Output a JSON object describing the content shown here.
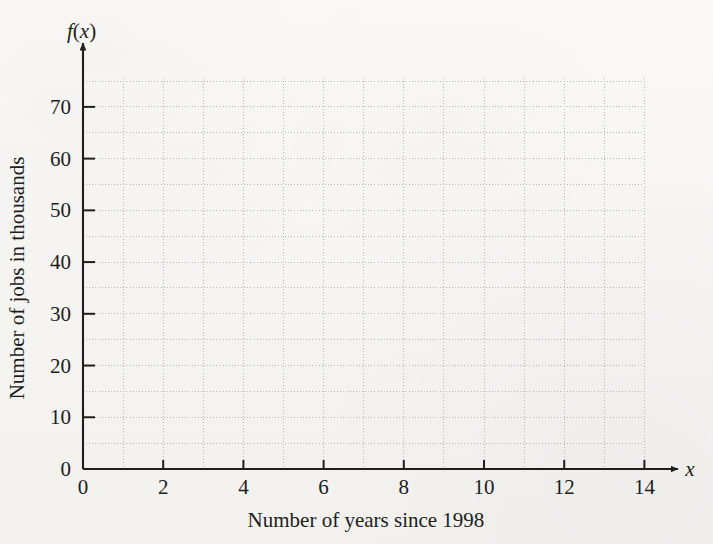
{
  "chart_data": {
    "type": "line",
    "title": "",
    "subtitle": "",
    "xlabel": "Number of years since 1998",
    "ylabel": "Number of jobs in thousands",
    "x_axis_name": "x",
    "y_axis_name": "f(x)",
    "xlim": [
      0,
      14
    ],
    "ylim": [
      0,
      75
    ],
    "x_tick_labels": [
      "0",
      "2",
      "4",
      "6",
      "8",
      "10",
      "12",
      "14"
    ],
    "x_tick_values": [
      0,
      2,
      4,
      6,
      8,
      10,
      12,
      14
    ],
    "y_tick_labels": [
      "0",
      "10",
      "20",
      "30",
      "40",
      "50",
      "60",
      "70"
    ],
    "y_tick_values": [
      0,
      10,
      20,
      30,
      40,
      50,
      60,
      70
    ],
    "grid": true,
    "grid_style": "dotted",
    "x_grid_step": 1,
    "y_grid_step": 5,
    "legend": null,
    "series": [],
    "values": [],
    "categories": [],
    "annotations": [],
    "note": "Empty coordinate grid provided for plotting; no data plotted."
  },
  "colors": {
    "paper": "#f7f6f3",
    "axis": "#201f1d",
    "grid": "#b9b8b4",
    "text": "#1d1d1d"
  },
  "geometry": {
    "origin_x": 83,
    "origin_y": 469,
    "px_per_x_unit": 40.1,
    "px_per_y_unit": 5.173,
    "grid_right": 644,
    "grid_top": 78,
    "x_arrow_end": 681,
    "y_arrow_end": 40
  }
}
